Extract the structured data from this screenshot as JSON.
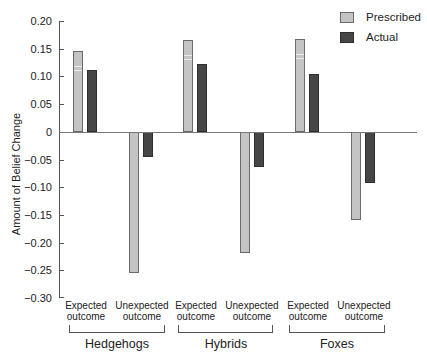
{
  "chart_data": {
    "type": "bar",
    "title": "",
    "xlabel": "",
    "ylabel": "Amount of Belief Change",
    "ylim": [
      -0.3,
      0.2
    ],
    "yticks": [
      "0.20",
      "0.15",
      "0.10",
      "0.05",
      "0",
      "-0.05",
      "-0.10",
      "-0.15",
      "-0.20",
      "-0.25",
      "-0.30"
    ],
    "grid": false,
    "legend_position": "top-right",
    "groups": [
      "Hedgehogs",
      "Hybrids",
      "Foxes"
    ],
    "categories": [
      "Hedgehogs - Expected outcome",
      "Hedgehogs - Unexpected outcome",
      "Hybrids - Expected outcome",
      "Hybrids - Unexpected outcome",
      "Foxes - Expected outcome",
      "Foxes - Unexpected outcome"
    ],
    "subcategories": [
      "Expected outcome",
      "Unexpected outcome"
    ],
    "series": [
      {
        "name": "Prescribed",
        "color": "#c4c4c4",
        "values": [
          0.146,
          -0.254,
          0.166,
          -0.218,
          0.168,
          -0.159
        ]
      },
      {
        "name": "Actual",
        "color": "#464646",
        "values": [
          0.112,
          -0.045,
          0.123,
          -0.063,
          0.105,
          -0.092
        ]
      }
    ]
  },
  "axis": {
    "ylabel": "Amount of Belief Change",
    "ticks": [
      "0.20",
      "0.15",
      "0.10",
      "0.05",
      "0",
      "−0.05",
      "−0.10",
      "−0.15",
      "−0.20",
      "−0.25",
      "−0.30"
    ]
  },
  "legend": {
    "prescribed": "Prescribed",
    "actual": "Actual"
  },
  "labels": {
    "expected_line1": "Expected",
    "unexpected_line1": "Unexpected",
    "line2": "outcome"
  },
  "groups": {
    "hedgehogs": "Hedgehogs",
    "hybrids": "Hybrids",
    "foxes": "Foxes"
  }
}
